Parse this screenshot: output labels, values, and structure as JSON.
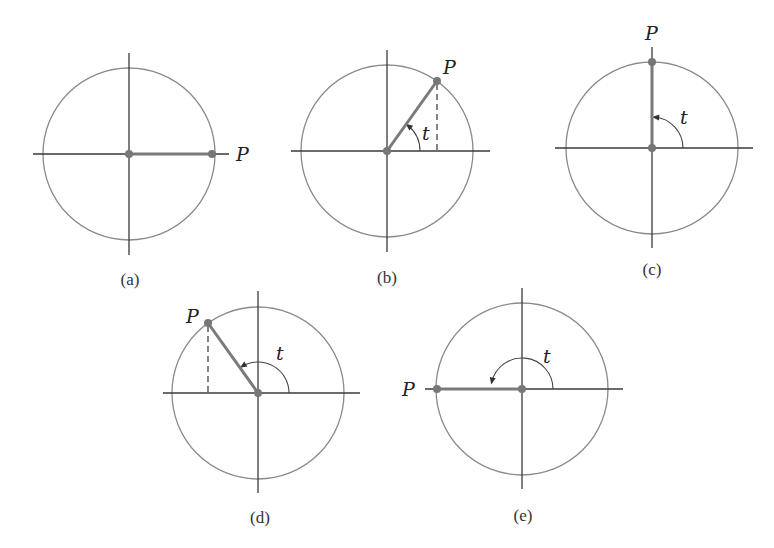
{
  "diagrams": [
    {
      "id": "a",
      "caption": "(a)",
      "center": [
        129,
        154
      ],
      "radius": 86,
      "h_axis": [
        33,
        229
      ],
      "v_axis": [
        53,
        255
      ],
      "point": [
        212,
        154
      ],
      "point_label": "P",
      "point_label_pos": [
        236,
        161
      ],
      "angle_label": "",
      "angle_label_pos": null,
      "arc": null,
      "dashed": null,
      "caption_pos": [
        130,
        285
      ]
    },
    {
      "id": "b",
      "caption": "(b)",
      "center": [
        387,
        151
      ],
      "radius": 86,
      "h_axis": [
        291,
        490
      ],
      "v_axis": [
        50,
        252
      ],
      "point": [
        437,
        81
      ],
      "point_label": "P",
      "point_label_pos": [
        443,
        74
      ],
      "angle_label": "t",
      "angle_label_pos": [
        422,
        140
      ],
      "arc": {
        "r": 33,
        "start": 0,
        "end": 52
      },
      "dashed": [
        [
          437,
          84
        ],
        [
          437,
          151
        ]
      ],
      "caption_pos": [
        387,
        283
      ]
    },
    {
      "id": "c",
      "caption": "(c)",
      "center": [
        652,
        148
      ],
      "radius": 86,
      "h_axis": [
        555,
        753
      ],
      "v_axis": [
        47,
        248
      ],
      "point": [
        652,
        62
      ],
      "point_label": "P",
      "point_label_pos": [
        645,
        40
      ],
      "angle_label": "t",
      "angle_label_pos": [
        680,
        124
      ],
      "arc": {
        "r": 31,
        "start": 0,
        "end": 86
      },
      "dashed": null,
      "caption_pos": [
        652,
        275
      ]
    },
    {
      "id": "d",
      "caption": "(d)",
      "center": [
        258,
        393
      ],
      "radius": 86,
      "h_axis": [
        163,
        360
      ],
      "v_axis": [
        291,
        493
      ],
      "point": [
        208,
        323
      ],
      "point_label": "P",
      "point_label_pos": [
        186,
        323
      ],
      "angle_label": "t",
      "angle_label_pos": [
        276,
        360
      ],
      "arc": {
        "r": 31,
        "start": 0,
        "end": 122
      },
      "dashed": [
        [
          208,
          326
        ],
        [
          208,
          393
        ]
      ],
      "caption_pos": [
        260,
        523
      ]
    },
    {
      "id": "e",
      "caption": "(e)",
      "center": [
        522,
        389
      ],
      "radius": 86,
      "h_axis": [
        425,
        623
      ],
      "v_axis": [
        288,
        489
      ],
      "point": [
        437,
        389
      ],
      "point_label": "P",
      "point_label_pos": [
        402,
        396
      ],
      "angle_label": "t",
      "angle_label_pos": [
        543,
        363
      ],
      "arc": {
        "r": 31,
        "start": 0,
        "end": 168
      },
      "dashed": null,
      "caption_pos": [
        523,
        521
      ]
    }
  ]
}
